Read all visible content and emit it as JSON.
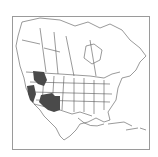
{
  "map": {
    "subject": "North America species range map",
    "frame_color": "#9a9a9a",
    "outline_color": "#555555",
    "range_color": "#4a4a4a",
    "ranges": [
      {
        "name": "pacific-northwest-range",
        "region": "Washington / Idaho / Oregon"
      },
      {
        "name": "california-range",
        "region": "California / Nevada"
      },
      {
        "name": "southwest-range",
        "region": "Arizona / New Mexico / Utah / Colorado"
      }
    ]
  }
}
